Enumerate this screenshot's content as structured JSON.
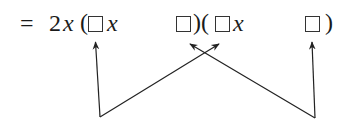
{
  "expression": {
    "equals": "=",
    "coefficient": "2",
    "variable": "x",
    "open_paren_1": "(",
    "close_paren_1": ")",
    "open_paren_2": "(",
    "close_paren_2": ")",
    "blank_box_icon": "empty-square"
  },
  "arrows": {
    "description": "Four arrows pointing up to the blank boxes: outer boxes linked by vertical arrows joined via V-shapes that cross to the inner boxes",
    "count": 4,
    "color": "#222222"
  }
}
